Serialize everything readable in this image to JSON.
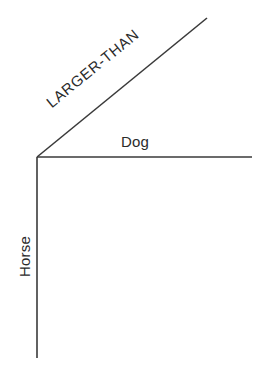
{
  "diagram": {
    "type": "relation-graph",
    "background_color": "#ffffff",
    "line_color": "#3a3a3a",
    "text_color": "#2b2b2b",
    "line_width_px": 1.6,
    "canvas": {
      "width": 258,
      "height": 373
    },
    "vertex": {
      "x": 37,
      "y": 157
    },
    "edges": [
      {
        "id": "diagonal-edge",
        "label": "LARGER-THAN",
        "from": {
          "x": 37,
          "y": 157
        },
        "to": {
          "x": 207,
          "y": 18
        },
        "angle_deg": -39.3,
        "label_case": "uppercase"
      },
      {
        "id": "horizontal-edge",
        "label": "Dog",
        "from": {
          "x": 37,
          "y": 157
        },
        "to": {
          "x": 252,
          "y": 157
        },
        "angle_deg": 0,
        "label_case": "title"
      },
      {
        "id": "vertical-edge",
        "label": "Horse",
        "from": {
          "x": 37,
          "y": 157
        },
        "to": {
          "x": 37,
          "y": 358
        },
        "angle_deg": -90,
        "label_case": "title"
      }
    ],
    "labels": {
      "relation": "LARGER-THAN",
      "horizontal_node": "Dog",
      "vertical_node": "Horse"
    }
  },
  "chart_data": {
    "type": "diagram",
    "title": "",
    "nodes": [
      "Dog",
      "Horse"
    ],
    "relation": "LARGER-THAN",
    "series": [
      {
        "name": "LARGER-THAN",
        "x": [
          37,
          207
        ],
        "y": [
          157,
          18
        ]
      },
      {
        "name": "Dog",
        "x": [
          37,
          252
        ],
        "y": [
          157,
          157
        ]
      },
      {
        "name": "Horse",
        "x": [
          37,
          37
        ],
        "y": [
          157,
          358
        ]
      }
    ],
    "xlabel": "",
    "ylabel": "",
    "grid": false,
    "legend": "none"
  }
}
